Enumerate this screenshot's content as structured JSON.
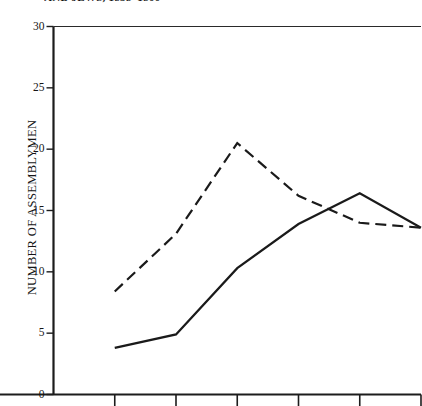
{
  "chart_data": {
    "type": "line",
    "title": "AND JEWS, 1838–1866",
    "xlabel": "",
    "ylabel": "NUMBER OF ASSEMBLYMEN",
    "ylim": [
      0,
      30
    ],
    "yticks": [
      0,
      5,
      10,
      15,
      20,
      25,
      30
    ],
    "ytick_labels": [
      "0",
      "5",
      "10",
      "15",
      "20",
      "25",
      "30"
    ],
    "xlim": [
      0,
      6
    ],
    "xticks": [
      0,
      1,
      2,
      3,
      4,
      5,
      6
    ],
    "xtick_labels": [
      "",
      "",
      "",
      "",
      "",
      "",
      ""
    ],
    "grid": false,
    "legend": "none",
    "series": [
      {
        "name": "dashed-series",
        "style": "dashed",
        "color": "#1a1a1a",
        "x": [
          1,
          2,
          3,
          4,
          5,
          6
        ],
        "values": [
          8.4,
          13.1,
          20.5,
          16.2,
          14.0,
          13.6
        ]
      },
      {
        "name": "solid-series",
        "style": "solid",
        "color": "#1a1a1a",
        "x": [
          1,
          2,
          3,
          4,
          5,
          6
        ],
        "values": [
          3.8,
          4.9,
          10.3,
          13.9,
          16.4,
          13.6
        ]
      }
    ]
  },
  "axes": {
    "y_title": "NUMBER OF ASSEMBLYMEN"
  }
}
